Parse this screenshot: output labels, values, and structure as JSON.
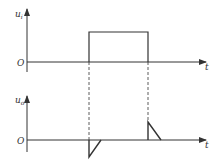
{
  "diagram": {
    "top": {
      "ylabel": "u",
      "ysub": "i",
      "origin": "O",
      "xlabel": "t",
      "signal": "rectangular pulse"
    },
    "bottom": {
      "ylabel": "u",
      "ysub": "o",
      "origin": "O",
      "xlabel": "t",
      "signal": "differentiated spikes: negative at rising edge, positive at falling edge"
    },
    "colors": {
      "line": "#333333",
      "background": "#ffffff"
    }
  }
}
